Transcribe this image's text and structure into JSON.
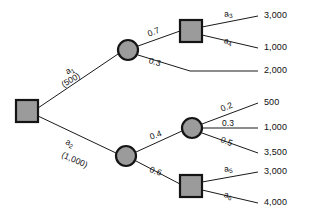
{
  "diagram": {
    "type": "decision-tree",
    "nodes": [
      {
        "id": "root",
        "kind": "decision",
        "shape": "square",
        "x": 27,
        "y": 111
      },
      {
        "id": "c1",
        "kind": "chance",
        "shape": "circle",
        "x": 128,
        "y": 50
      },
      {
        "id": "d2",
        "kind": "decision",
        "shape": "square",
        "x": 191,
        "y": 31
      },
      {
        "id": "c2",
        "kind": "chance",
        "shape": "circle",
        "x": 126,
        "y": 156
      },
      {
        "id": "c3",
        "kind": "chance",
        "shape": "circle",
        "x": 192,
        "y": 128
      },
      {
        "id": "d3",
        "kind": "decision",
        "shape": "square",
        "x": 191,
        "y": 186
      }
    ],
    "branches": {
      "root_up": {
        "action": "a",
        "action_index": "1",
        "value": "(500)"
      },
      "root_down": {
        "action": "a",
        "action_index": "2",
        "value": "(1,000)"
      },
      "c1_up": {
        "probability": "0.7"
      },
      "c1_down": {
        "probability": "0.3"
      },
      "d2_up": {
        "action": "a",
        "action_index": "3"
      },
      "d2_down": {
        "action": "a",
        "action_index": "4"
      },
      "c2_up": {
        "probability": "0.4"
      },
      "c2_down": {
        "probability": "0.6"
      },
      "c3_up": {
        "probability": "0.2"
      },
      "c3_mid": {
        "probability": "0.3"
      },
      "c3_down": {
        "probability": "0.5"
      },
      "d3_up": {
        "action": "a",
        "action_index": "5"
      },
      "d3_down": {
        "action": "a",
        "action_index": "6"
      }
    },
    "payoffs": {
      "p1": "3,000",
      "p2": "1,000",
      "p3": "2,000",
      "p4": "500",
      "p5": "1,000",
      "p6": "3,500",
      "p7": "3,000",
      "p8": "4,000"
    },
    "colors": {
      "node_fill": "#9b9b9b",
      "node_stroke": "#141414",
      "line": "#1a1a1a",
      "text": "#101010",
      "background": "#ffffff"
    }
  }
}
